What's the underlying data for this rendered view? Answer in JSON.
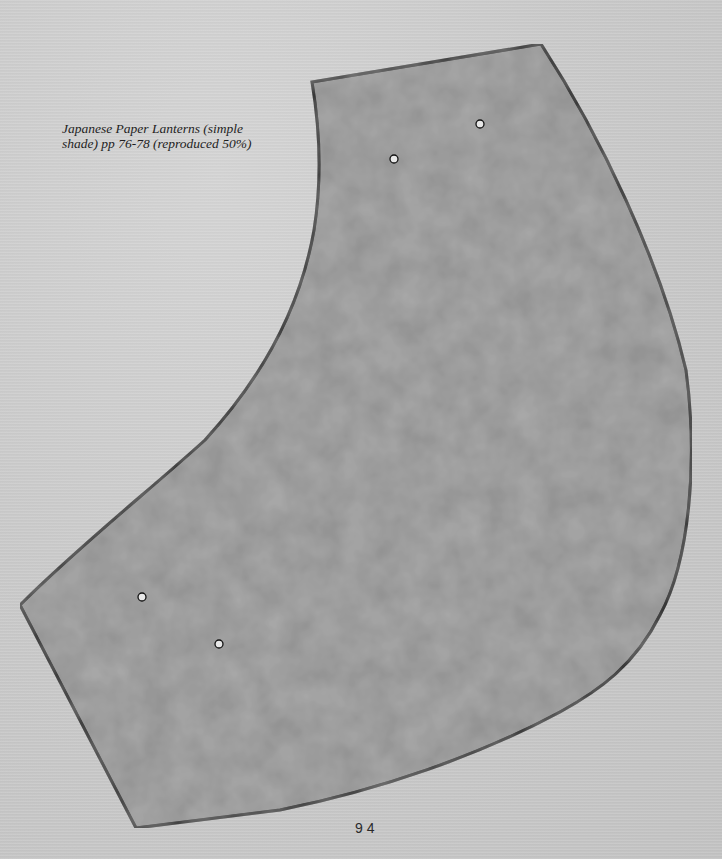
{
  "caption": {
    "line1": "Japanese Paper Lanterns (simple",
    "line2": "shade) pp 76-78 (reproduced 50%)"
  },
  "page_number": "94",
  "pattern_piece": {
    "shape": "lantern-shade-panel",
    "fill_color": "#8f8f8f",
    "outline_color": "#0a0a0a",
    "corners": {
      "top_left": [
        312,
        82
      ],
      "top_right": [
        541,
        44
      ],
      "left_point": [
        20,
        605
      ],
      "bottom_point": [
        136,
        828
      ]
    },
    "registration_dots": [
      {
        "x": 394,
        "y": 159
      },
      {
        "x": 480,
        "y": 124
      },
      {
        "x": 142,
        "y": 597
      },
      {
        "x": 219,
        "y": 644
      }
    ]
  },
  "colors": {
    "paper_background": "#cbcbcb",
    "text": "#1e1e1e"
  }
}
